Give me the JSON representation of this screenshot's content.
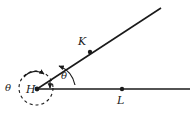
{
  "figure": {
    "background_color": "#ffffff",
    "stroke_color": "#1a1a1a"
  },
  "points": [
    {
      "id": "H",
      "label": "H",
      "x": 37,
      "y": 89,
      "label_x": 26,
      "label_y": 84,
      "dot": true
    },
    {
      "id": "K",
      "label": "K",
      "x": 90,
      "y": 52,
      "label_x": 78,
      "label_y": 36,
      "dot": true
    },
    {
      "id": "L",
      "label": "L",
      "x": 122,
      "y": 89,
      "label_x": 117,
      "label_y": 95,
      "dot": true
    }
  ],
  "rays": [
    {
      "id": "ray-HL",
      "from": "H",
      "through": "L",
      "end_x": 190,
      "end_y": 89,
      "label": "horizontal ray HL"
    },
    {
      "id": "ray-HK",
      "from": "H",
      "through": "K",
      "end_x": 161,
      "end_y": 8,
      "label": "slanted ray HK"
    }
  ],
  "angles": [
    {
      "id": "interior-angle",
      "symbol": "θ",
      "label_x": 61,
      "label_y": 71,
      "description": "interior angle between ray HL and ray HK"
    },
    {
      "id": "reflex-angle",
      "symbol": "θ",
      "label_x": 5,
      "label_y": 83,
      "description": "reflex angle marked by dashed circle around H"
    }
  ],
  "reflex_marker": {
    "type": "dashed-circle",
    "center_x": 36,
    "center_y": 88,
    "radius": 17,
    "dash_pattern": "3 3"
  }
}
